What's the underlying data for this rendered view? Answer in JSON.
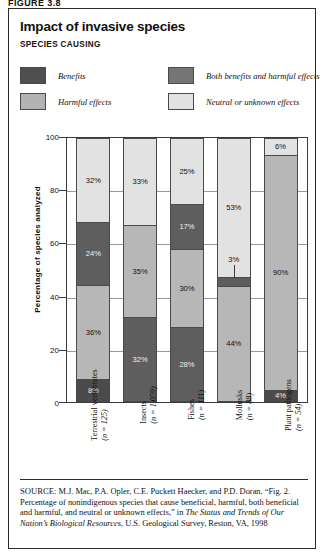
{
  "figure_top_text": "FIGURE 3.8",
  "panel": {
    "title": "Impact of invasive species",
    "subtitle": "SPECIES CAUSING"
  },
  "legend": {
    "items": [
      {
        "label": "Benefits",
        "color": "#4f4f4f",
        "key": "benefits"
      },
      {
        "label": "Both benefits and harmful effects",
        "color": "#757575",
        "key": "both"
      },
      {
        "label": "Harmful effects",
        "color": "#b3b3b3",
        "key": "harmful"
      },
      {
        "label": "Neutral or unknown effects",
        "color": "#e2e2e2",
        "key": "neutral"
      }
    ]
  },
  "axis": {
    "ylabel": "Percentage of species analyzed",
    "yticks": [
      "100",
      "80",
      "60",
      "40",
      "20",
      "0"
    ]
  },
  "source": {
    "prefix": "SOURCE:",
    "line1": " M.J. Mac, P.A. Opler, C.E. Puckett Haecker, and P.D. Doran,",
    "line2": "“Fig. 2. Percentage of nonindigenous species that cause beneficial,",
    "line3": "harmful, both beneficial and harmful, and neutral or unknown effects,” in",
    "italic_title": "The Status and Trends of Our Nation’s Biological Resources",
    "line4_tail": ", U.S.",
    "line5": "Geological Survey, Reston, VA, 1998"
  },
  "chart_data": {
    "type": "bar",
    "subtype": "stacked-100-percent",
    "title": "Impact of invasive species",
    "subtitle": "SPECIES CAUSING",
    "xlabel": "",
    "ylabel": "Percentage of species analyzed",
    "ylim": [
      0,
      100
    ],
    "yticks": [
      0,
      20,
      40,
      60,
      80,
      100
    ],
    "grid": true,
    "legend_position": "top",
    "categories": [
      "Terrestrial vertebrates",
      "Insects",
      "Fishes",
      "Mollusks",
      "Plant pathogens"
    ],
    "category_n": [
      "(n = 125)",
      "(n = 1,059)",
      "(n = 111)",
      "(n = 88)",
      "(n = 54)"
    ],
    "series": [
      {
        "name": "Benefits",
        "color": "#4f4f4f",
        "values": [
          8,
          32,
          28,
          0,
          4
        ]
      },
      {
        "name": "Harmful effects",
        "color": "#b3b3b3",
        "values": [
          36,
          35,
          30,
          44,
          90
        ]
      },
      {
        "name": "Both benefits and harmful effects",
        "color": "#757575",
        "values": [
          24,
          0,
          17,
          3,
          0
        ]
      },
      {
        "name": "Neutral or unknown effects",
        "color": "#e2e2e2",
        "values": [
          32,
          33,
          25,
          53,
          6
        ]
      }
    ],
    "bars": [
      {
        "category": "Terrestrial vertebrates",
        "n": "(n = 125)",
        "segments": [
          {
            "series": "Neutral or unknown effects",
            "value": 32,
            "label": "32%",
            "color": "#e2e2e2",
            "dark": false,
            "tiny": false
          },
          {
            "series": "Both benefits and harmful effects",
            "value": 24,
            "label": "24%",
            "color": "#5e5e5e",
            "dark": true,
            "tiny": false
          },
          {
            "series": "Harmful effects",
            "value": 36,
            "label": "36%",
            "color": "#b7b7b7",
            "dark": false,
            "tiny": false
          },
          {
            "series": "Benefits",
            "value": 8,
            "label": "8%",
            "color": "#4b4b4b",
            "dark": true,
            "tiny": false
          }
        ]
      },
      {
        "category": "Insects",
        "n": "(n = 1,059)",
        "segments": [
          {
            "series": "Neutral or unknown effects",
            "value": 33,
            "label": "33%",
            "color": "#e2e2e2",
            "dark": false,
            "tiny": false
          },
          {
            "series": "Harmful effects",
            "value": 35,
            "label": "35%",
            "color": "#b7b7b7",
            "dark": false,
            "tiny": false
          },
          {
            "series": "Benefits",
            "value": 32,
            "label": "32%",
            "color": "#5e5e5e",
            "dark": true,
            "tiny": false
          }
        ]
      },
      {
        "category": "Fishes",
        "n": "(n = 111)",
        "segments": [
          {
            "series": "Neutral or unknown effects",
            "value": 25,
            "label": "25%",
            "color": "#e2e2e2",
            "dark": false,
            "tiny": false
          },
          {
            "series": "Both benefits and harmful effects",
            "value": 17,
            "label": "17%",
            "color": "#5e5e5e",
            "dark": true,
            "tiny": false
          },
          {
            "series": "Harmful effects",
            "value": 30,
            "label": "30%",
            "color": "#b7b7b7",
            "dark": false,
            "tiny": false
          },
          {
            "series": "Benefits",
            "value": 28,
            "label": "28%",
            "color": "#5e5e5e",
            "dark": true,
            "tiny": false
          }
        ]
      },
      {
        "category": "Mollusks",
        "n": "(n = 88)",
        "segments": [
          {
            "series": "Neutral or unknown effects",
            "value": 53,
            "label": "53%",
            "color": "#e2e2e2",
            "dark": false,
            "tiny": false
          },
          {
            "series": "Both benefits and harmful effects",
            "value": 3,
            "label": "3%",
            "color": "#5e5e5e",
            "dark": true,
            "tiny": true
          },
          {
            "series": "Harmful effects",
            "value": 44,
            "label": "44%",
            "color": "#b7b7b7",
            "dark": false,
            "tiny": false
          }
        ]
      },
      {
        "category": "Plant pathogens",
        "n": "(n = 54)",
        "segments": [
          {
            "series": "Neutral or unknown effects",
            "value": 6,
            "label": "6%",
            "color": "#e2e2e2",
            "dark": false,
            "tiny": false
          },
          {
            "series": "Harmful effects",
            "value": 90,
            "label": "90%",
            "color": "#b7b7b7",
            "dark": false,
            "tiny": false
          },
          {
            "series": "Benefits",
            "value": 4,
            "label": "4%",
            "color": "#4b4b4b",
            "dark": true,
            "tiny": false
          }
        ]
      }
    ]
  }
}
